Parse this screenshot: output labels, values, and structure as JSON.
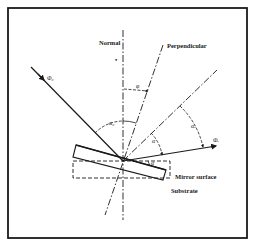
{
  "diagram": {
    "labels": {
      "normal": "Normal",
      "perpendicular": "Perpendicular",
      "mirror_surface": "Mirror surface",
      "substrate": "Substrate"
    },
    "symbols": {
      "incident": "Φ₀",
      "reflected": "Φᵣ",
      "phi": "φ",
      "alpha_zero": "α₀",
      "alpha": "α",
      "alpha_r": "αᵣ",
      "small_angle": "α",
      "normal_dot": "•"
    },
    "colors": {
      "line": "#1a1a1a",
      "background": "#ffffff"
    }
  }
}
